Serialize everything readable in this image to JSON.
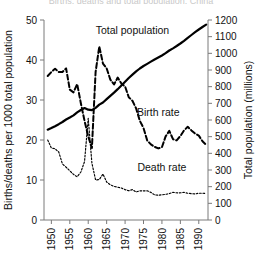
{
  "figure": {
    "clipped_top_title": "Births, deaths and total population, China",
    "background": "#ffffff",
    "ink_color": "#000000",
    "axis_color": "#7a7a7a"
  },
  "labels": {
    "left_axis_title": "Births/deaths per 1000 total population",
    "right_axis_title": "Total population (millions)",
    "total_population": "Total population",
    "birth_rate": "Birth rate",
    "death_rate": "Death rate"
  },
  "chart_data": {
    "type": "line",
    "title": "",
    "xlabel": "",
    "ylabel": "Births/deaths per 1000 total population",
    "y2label": "Total population (millions)",
    "xlim": [
      1948,
      1992.5
    ],
    "ylim": [
      0,
      50
    ],
    "y2lim": [
      0,
      1200
    ],
    "grid": false,
    "legend": "inline-annotations",
    "xticks": [
      1950,
      1955,
      1960,
      1965,
      1970,
      1975,
      1980,
      1985,
      1990
    ],
    "xtick_labels": [
      "1950",
      "1955",
      "1960",
      "1965",
      "1970",
      "1975",
      "1980",
      "1985",
      "1990"
    ],
    "xtick_rotation": 90,
    "yticks": [
      0,
      10,
      20,
      30,
      40,
      50
    ],
    "ytick_labels": [
      "0",
      "10",
      "20",
      "30",
      "40",
      "50"
    ],
    "y2ticks": [
      0,
      100,
      200,
      300,
      400,
      500,
      600,
      700,
      800,
      900,
      1000,
      1100,
      1200
    ],
    "y2tick_labels": [
      "0",
      "100",
      "200",
      "300",
      "400",
      "500",
      "600",
      "700",
      "800",
      "900",
      "1000",
      "1100",
      "1200"
    ],
    "series": [
      {
        "name": "Total population",
        "axis": "right",
        "style": "solid-thick",
        "units": "millions",
        "x": [
          1949,
          1950,
          1951,
          1952,
          1953,
          1954,
          1955,
          1956,
          1957,
          1958,
          1959,
          1960,
          1961,
          1962,
          1963,
          1964,
          1965,
          1966,
          1967,
          1968,
          1969,
          1970,
          1971,
          1972,
          1973,
          1974,
          1975,
          1976,
          1977,
          1978,
          1979,
          1980,
          1981,
          1982,
          1983,
          1984,
          1985,
          1986,
          1987,
          1988,
          1989,
          1990,
          1991,
          1992
        ],
        "values": [
          542,
          552,
          563,
          575,
          588,
          603,
          615,
          628,
          646,
          660,
          672,
          662,
          659,
          673,
          692,
          705,
          725,
          745,
          764,
          785,
          807,
          830,
          852,
          872,
          892,
          909,
          924,
          937,
          950,
          963,
          975,
          987,
          1001,
          1017,
          1030,
          1044,
          1059,
          1075,
          1093,
          1110,
          1127,
          1143,
          1158,
          1172
        ]
      },
      {
        "name": "Birth rate",
        "axis": "left",
        "style": "dashed",
        "units": "per 1000",
        "x": [
          1949,
          1950,
          1951,
          1952,
          1953,
          1954,
          1955,
          1956,
          1957,
          1958,
          1959,
          1960,
          1961,
          1962,
          1963,
          1964,
          1965,
          1966,
          1967,
          1968,
          1969,
          1970,
          1971,
          1972,
          1973,
          1974,
          1975,
          1976,
          1977,
          1978,
          1979,
          1980,
          1981,
          1982,
          1983,
          1984,
          1985,
          1986,
          1987,
          1988,
          1989,
          1990,
          1991,
          1992
        ],
        "values": [
          36.0,
          37.0,
          37.8,
          37.0,
          37.0,
          37.9,
          32.6,
          31.9,
          34.0,
          29.2,
          24.8,
          20.9,
          18.0,
          37.0,
          43.4,
          39.1,
          37.9,
          35.1,
          33.9,
          35.6,
          34.1,
          33.4,
          30.7,
          29.8,
          27.9,
          24.8,
          23.0,
          19.9,
          18.9,
          18.3,
          17.9,
          18.2,
          20.9,
          22.3,
          20.2,
          19.9,
          21.0,
          22.4,
          23.3,
          22.4,
          21.6,
          21.1,
          19.7,
          18.8
        ]
      },
      {
        "name": "Death rate",
        "axis": "left",
        "style": "dotted",
        "units": "per 1000",
        "x": [
          1949,
          1950,
          1951,
          1952,
          1953,
          1954,
          1955,
          1956,
          1957,
          1958,
          1959,
          1960,
          1961,
          1962,
          1963,
          1964,
          1965,
          1966,
          1967,
          1968,
          1969,
          1970,
          1971,
          1972,
          1973,
          1974,
          1975,
          1976,
          1977,
          1978,
          1979,
          1980,
          1981,
          1982,
          1983,
          1984,
          1985,
          1986,
          1987,
          1988,
          1989,
          1990,
          1991,
          1992
        ],
        "values": [
          20.0,
          18.0,
          17.8,
          17.0,
          14.0,
          13.2,
          12.3,
          11.4,
          10.8,
          12.0,
          14.6,
          25.4,
          14.2,
          10.0,
          10.1,
          11.5,
          9.5,
          8.8,
          8.4,
          8.2,
          8.0,
          7.6,
          7.3,
          7.6,
          7.0,
          7.3,
          7.3,
          7.3,
          6.9,
          6.3,
          6.2,
          6.3,
          6.4,
          6.6,
          6.9,
          6.8,
          6.8,
          6.9,
          6.7,
          6.6,
          6.5,
          6.7,
          6.7,
          6.6
        ]
      }
    ],
    "annotations": [
      {
        "text": "Total population",
        "x": 1972,
        "y_left": 46.5
      },
      {
        "text": "Birth rate",
        "x": 1979,
        "y_left": 26.0
      },
      {
        "text": "Death rate",
        "x": 1980,
        "y_left": 12.3
      }
    ]
  }
}
